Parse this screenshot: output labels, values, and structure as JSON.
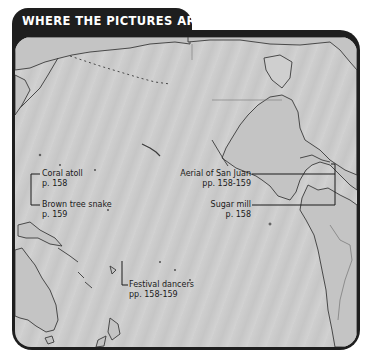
{
  "header": {
    "title": "WHERE THE PICTURES ARE"
  },
  "map": {
    "region": "Pacific Ocean",
    "colors": {
      "frame": "#1e1e1e",
      "ocean": "#cccccc",
      "coastline": "#3a3a3a",
      "title_text": "#ffffff"
    },
    "labels": [
      {
        "name": "Coral atoll",
        "page": "p. 158"
      },
      {
        "name": "Brown tree snake",
        "page": "p. 159"
      },
      {
        "name": "Festival dancers",
        "page": "pp. 158-159"
      },
      {
        "name": "Aerial of San Juan",
        "page": "pp. 158-159"
      },
      {
        "name": "Sugar mill",
        "page": "p. 158"
      }
    ]
  }
}
